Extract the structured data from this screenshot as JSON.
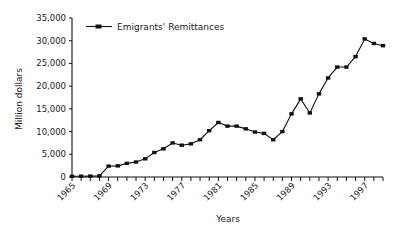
{
  "chart_data": {
    "type": "line",
    "title": "",
    "xlabel": "Years",
    "ylabel": "Million dollars",
    "xlim": [
      1965,
      1999
    ],
    "ylim": [
      0,
      35000
    ],
    "ytick_step": 5000,
    "yticks": [
      0,
      5000,
      10000,
      15000,
      20000,
      25000,
      30000,
      35000
    ],
    "ytick_labels": [
      "0",
      "5,000",
      "10,000",
      "15,000",
      "20,000",
      "25,000",
      "30,000",
      "35,000"
    ],
    "xticks": [
      1965,
      1966,
      1967,
      1968,
      1969,
      1970,
      1971,
      1972,
      1973,
      1974,
      1975,
      1976,
      1977,
      1978,
      1979,
      1980,
      1981,
      1982,
      1983,
      1984,
      1985,
      1986,
      1987,
      1988,
      1989,
      1990,
      1991,
      1992,
      1993,
      1994,
      1995,
      1996,
      1997,
      1998,
      1999
    ],
    "xtick_labels": [
      "1965",
      "1969",
      "1973",
      "1977",
      "1981",
      "1985",
      "1989",
      "1993",
      "1997"
    ],
    "xtick_label_years": [
      1965,
      1969,
      1973,
      1977,
      1981,
      1985,
      1989,
      1993,
      1997
    ],
    "xtick_label_rotation": -45,
    "grid": false,
    "legend_position": "top-left",
    "legend_entries": [
      "Emigrants' Remittances"
    ],
    "marker": "square",
    "line_color": "#111111",
    "series": [
      {
        "name": "Emigrants' Remittances",
        "x": [
          1965,
          1966,
          1967,
          1968,
          1969,
          1970,
          1971,
          1972,
          1973,
          1974,
          1975,
          1976,
          1977,
          1978,
          1979,
          1980,
          1981,
          1982,
          1983,
          1984,
          1985,
          1986,
          1987,
          1988,
          1989,
          1990,
          1991,
          1992,
          1993,
          1994,
          1995,
          1996,
          1997,
          1998,
          1999
        ],
        "values": [
          150,
          180,
          200,
          250,
          2400,
          2450,
          3000,
          3300,
          4000,
          5400,
          6200,
          7500,
          7000,
          7300,
          8200,
          10200,
          12000,
          11200,
          11200,
          10600,
          9900,
          9600,
          8200,
          10000,
          13900,
          17200,
          14100,
          18300,
          21800,
          24200,
          24200,
          26500,
          30400,
          29400,
          28900
        ]
      }
    ]
  },
  "yaxis": {
    "label": "Million dollars"
  },
  "xaxis": {
    "label": "Years"
  },
  "legend": {
    "label": "Emigrants' Remittances"
  }
}
